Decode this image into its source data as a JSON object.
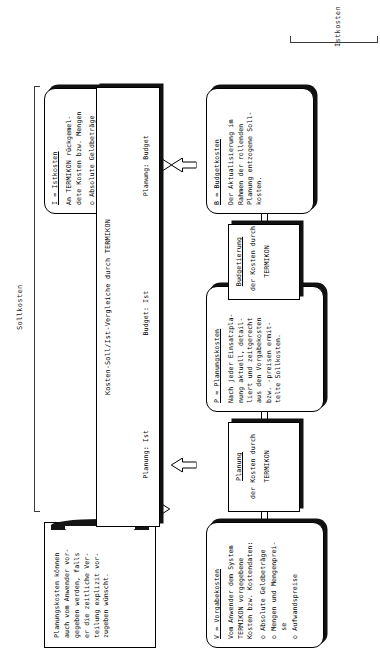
{
  "diagram": {
    "title_groups": [
      {
        "label": "Sollkosten"
      },
      {
        "label": "Istkosten"
      }
    ]
  },
  "nodes": {
    "vorgabekosten": {
      "title": "V = Vorgabekosten",
      "lines": [
        "Vom Anwender dem System",
        "TERMIKON vorgegebene",
        "Kosten bzw. Kostendaten:"
      ],
      "bullets": [
        "o Absolute Geldbeträge",
        "o Mengen und Mengenprei-",
        "  se",
        "o Aufwandspreise"
      ]
    },
    "planungskosten": {
      "title": "P = Planungskosten",
      "lines": [
        "Nach jeder Einsatzpla-",
        "nung aktuell, detail-",
        "liert und zeitgerecht",
        "aus den Vorgabekosten",
        "bzw. -preisen ermit-",
        "telte Sollkosten."
      ]
    },
    "budgetkosten": {
      "title": "B = Budgetkosten",
      "lines": [
        "Der Aktualisierung im",
        "Rahmen der rollenden",
        "Planung entzogene Soll-",
        "kosten."
      ]
    },
    "istkosten": {
      "title": "I = Istkosten",
      "lines": [
        "An TERMIKON rückgemel-",
        "dete Kosten bzw. Mengen"
      ],
      "bullets": [
        "o Absolute Geldbeträge",
        "o Istmengen",
        "o Istaufwände"
      ]
    }
  },
  "processes": {
    "planung": {
      "title": "Planung",
      "line1": "der Kosten durch",
      "line2": "TERMIKON"
    },
    "budgetierung": {
      "title": "Budgetierung",
      "line1": "der Kosten durch",
      "line2": "TERMIKON"
    }
  },
  "comparison": {
    "title": "Kosten-Soll/Ist-Vergleiche durch TERMIKON",
    "pairs": [
      "Planung: Ist",
      "Budget: Ist",
      "Planung: Budget"
    ]
  },
  "note": {
    "lines": [
      "Planungskosten können",
      "auch vom Anwender vor-",
      "gegeben werden, falls",
      "er die zeitliche Ver-",
      "teilung explizit vor-",
      "zugeben wünscht."
    ]
  },
  "colors": {
    "ink": "#000000",
    "shadow": "#111111",
    "paper": "#ffffff"
  }
}
